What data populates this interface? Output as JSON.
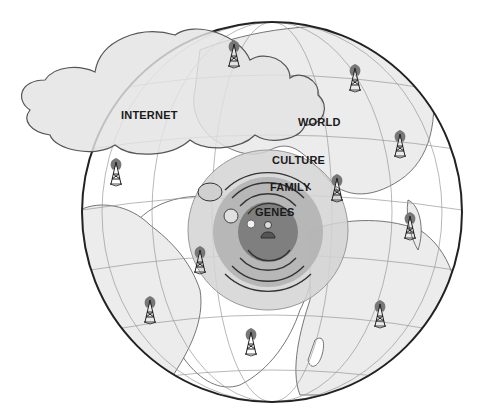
{
  "diagram": {
    "type": "concentric-influence-globe",
    "labels": {
      "internet": "INTERNET",
      "world": "WORLD",
      "culture": "CULTURE",
      "family": "FAMILY",
      "genes": "GENES"
    },
    "layers": [
      {
        "name": "GENES",
        "order": 1,
        "shade": "#7d7d7d"
      },
      {
        "name": "FAMILY",
        "order": 2,
        "shade": "#a9a9a9"
      },
      {
        "name": "CULTURE",
        "order": 3,
        "shade": "#d2d2d2"
      },
      {
        "name": "WORLD",
        "order": 4,
        "shade": "#efefef"
      },
      {
        "name": "INTERNET",
        "order": 5,
        "shade": "#e4e4e4"
      }
    ],
    "center_figure": "person-icon",
    "antenna_count": 10,
    "colors": {
      "ocean": "#ffffff",
      "land": "#ececec",
      "outline": "#333333",
      "gridline": "#9a9a9a",
      "cloud": "#e6e6e6"
    }
  }
}
